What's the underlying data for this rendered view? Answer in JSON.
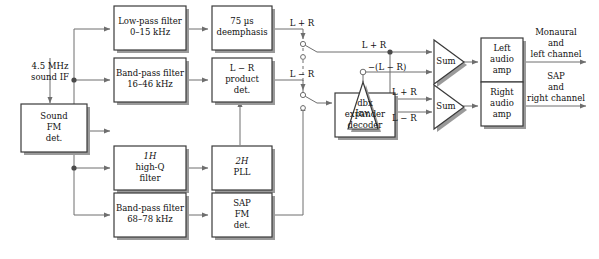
{
  "diagram": {
    "colors": {
      "line": "#6e6e6e",
      "box_border": "#3a3a3a",
      "shadow": "#9a9a9a",
      "text": "#111111",
      "background": "#ffffff"
    },
    "input": {
      "label_line1": "4.5 MHz",
      "label_line2": "sound IF"
    },
    "blocks": [
      {
        "id": "sound-fm-det",
        "lines": [
          "Sound",
          "FM",
          "det."
        ]
      },
      {
        "id": "low-pass-filter",
        "lines": [
          "Low-pass filter",
          "0–15 kHz"
        ]
      },
      {
        "id": "deemphasis",
        "lines": [
          "75 µs",
          "deemphasis"
        ]
      },
      {
        "id": "band-pass-filter-16-46",
        "lines": [
          "Band-pass filter",
          "16–46 kHz"
        ]
      },
      {
        "id": "lr-product-det",
        "lines": [
          "L − R",
          "product",
          "det."
        ]
      },
      {
        "id": "high-q-filter",
        "lines": [
          "1H",
          "high-Q",
          "filter"
        ],
        "italic_parts": [
          "H",
          "Q"
        ]
      },
      {
        "id": "pll",
        "lines": [
          "2H",
          "PLL"
        ],
        "italic_parts": [
          "H"
        ]
      },
      {
        "id": "band-pass-filter-68-78",
        "lines": [
          "Band-pass filter",
          "68–78 kHz"
        ]
      },
      {
        "id": "sap-fm-det",
        "lines": [
          "SAP",
          "FM",
          "det."
        ]
      },
      {
        "id": "dbx-expander-decoder",
        "lines": [
          "dbx",
          "expander",
          "decoder"
        ]
      },
      {
        "id": "left-audio-amp",
        "lines": [
          "Left",
          "audio",
          "amp"
        ]
      },
      {
        "id": "right-audio-amp",
        "lines": [
          "Right",
          "audio",
          "amp"
        ]
      }
    ],
    "amplifiers": [
      {
        "id": "inverter",
        "label": "Inv."
      },
      {
        "id": "sum-top",
        "label": "Sum"
      },
      {
        "id": "sum-bottom",
        "label": "Sum"
      }
    ],
    "signal_labels": {
      "l_plus_r_switch": "L + R",
      "l_minus_r_switch": "L − R",
      "l_plus_r_top": "L + R",
      "neg_l_minus_r": "−(L − R)",
      "l_plus_r_bottom": "L + R",
      "l_minus_r_bottom": "L − R"
    },
    "outputs": [
      {
        "id": "output-monaural-left",
        "lines": [
          "Monaural",
          "and",
          "left channel"
        ]
      },
      {
        "id": "output-sap-right",
        "lines": [
          "SAP",
          "and",
          "right channel"
        ]
      }
    ],
    "caption": ""
  }
}
